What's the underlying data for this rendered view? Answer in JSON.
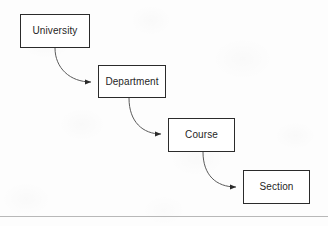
{
  "diagram": {
    "type": "flow-hierarchy",
    "background_color": "#fdfdfd",
    "stroke_color": "#2b2b2b",
    "text_color": "#1f1f1f",
    "nodes": [
      {
        "id": "university",
        "label": "University",
        "x": 20,
        "y": 14,
        "width": 70,
        "height": 34
      },
      {
        "id": "department",
        "label": "Department",
        "x": 98,
        "y": 65,
        "width": 68,
        "height": 33
      },
      {
        "id": "course",
        "label": "Course",
        "x": 168,
        "y": 118,
        "width": 67,
        "height": 34
      },
      {
        "id": "section",
        "label": "Section",
        "x": 243,
        "y": 170,
        "width": 67,
        "height": 34
      }
    ],
    "edges": [
      {
        "id": "edge-university-department",
        "from": "university",
        "to": "department",
        "style": "curved",
        "arrowhead": "filled-triangle"
      },
      {
        "id": "edge-department-course",
        "from": "department",
        "to": "course",
        "style": "curved",
        "arrowhead": "filled-triangle"
      },
      {
        "id": "edge-course-section",
        "from": "course",
        "to": "section",
        "style": "curved",
        "arrowhead": "filled-triangle"
      }
    ],
    "footer_rule_color": "#b8b8b8"
  }
}
